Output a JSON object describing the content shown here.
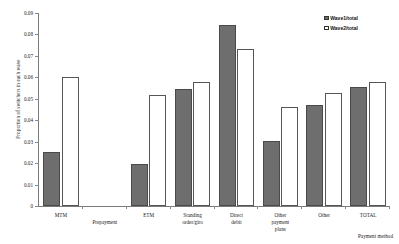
{
  "chart_data": {
    "type": "bar",
    "title": "",
    "xlabel": "Payment method",
    "ylabel": "Proportion of switchers in each wave",
    "ylim": [
      0,
      0.09
    ],
    "yticks": [
      "0",
      "0.01",
      "0.02",
      "0.03",
      "0.04",
      "0.05",
      "0.06",
      "0.07",
      "0.08",
      "0.09"
    ],
    "ytick_values": [
      0,
      0.01,
      0.02,
      0.03,
      0.04,
      0.05,
      0.06,
      0.07,
      0.08,
      0.09
    ],
    "grid": false,
    "legend_position": "top-right",
    "categories": [
      "MTM",
      "Prepayment",
      "ETM",
      "Standing\norder/giro",
      "Direct\ndebit",
      "Other\npayment\nplans",
      "Other",
      "TOTAL"
    ],
    "series": [
      {
        "name": "Wave1/total",
        "color": "#6e6e6e",
        "values": [
          0.025,
          null,
          0.0195,
          0.0548,
          0.0845,
          0.0305,
          0.047,
          0.0555
        ]
      },
      {
        "name": "Wave2/total",
        "color": "#ffffff",
        "values": [
          0.06,
          null,
          0.052,
          0.058,
          0.073,
          0.046,
          0.0525,
          0.058
        ]
      }
    ]
  },
  "legend": {
    "items": [
      {
        "label": "Wave1/total",
        "swatch": "filled-grey"
      },
      {
        "label": "Wave2/total",
        "swatch": "open-white"
      }
    ]
  },
  "axes": {
    "y_title": "Proportion of switchers in each wave",
    "x_title": "Payment method"
  }
}
